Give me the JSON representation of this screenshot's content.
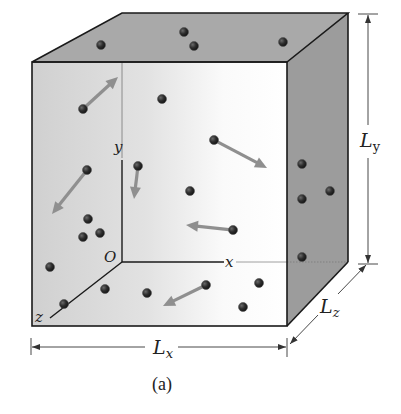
{
  "figure": {
    "caption": "(a)"
  },
  "axes": {
    "origin_label": "O",
    "x_label": "x",
    "y_label": "y",
    "z_label": "z"
  },
  "dimensions": {
    "Lx": {
      "main": "L",
      "sub": "x"
    },
    "Ly": {
      "main": "L",
      "sub": "y"
    },
    "Lz": {
      "main": "L",
      "sub": "z"
    }
  },
  "colors": {
    "top_face": "#a8a8a8",
    "right_face": "#9a9a9a",
    "front_face_left": "#d2d2d2",
    "front_face_right": "#fbfbfb",
    "edge": "#1a1a1a",
    "molecule": "#2a2a2a",
    "arrow": "#8f8f8f",
    "dimension_line": "#444444"
  },
  "molecules": [
    {
      "x": 101,
      "y": 45
    },
    {
      "x": 184,
      "y": 32
    },
    {
      "x": 194,
      "y": 46
    },
    {
      "x": 283,
      "y": 42
    },
    {
      "x": 83,
      "y": 109
    },
    {
      "x": 162,
      "y": 99
    },
    {
      "x": 214,
      "y": 140
    },
    {
      "x": 138,
      "y": 166
    },
    {
      "x": 87,
      "y": 170
    },
    {
      "x": 190,
      "y": 191
    },
    {
      "x": 88,
      "y": 219
    },
    {
      "x": 83,
      "y": 237
    },
    {
      "x": 100,
      "y": 233
    },
    {
      "x": 233,
      "y": 230
    },
    {
      "x": 50,
      "y": 267
    },
    {
      "x": 105,
      "y": 289
    },
    {
      "x": 147,
      "y": 293
    },
    {
      "x": 206,
      "y": 285
    },
    {
      "x": 259,
      "y": 283
    },
    {
      "x": 243,
      "y": 307
    },
    {
      "x": 64,
      "y": 304
    },
    {
      "x": 302,
      "y": 164
    },
    {
      "x": 302,
      "y": 199
    },
    {
      "x": 330,
      "y": 191
    },
    {
      "x": 302,
      "y": 257
    }
  ],
  "velocity_arrows": [
    {
      "x1": 83,
      "y1": 109,
      "x2": 118,
      "y2": 77
    },
    {
      "x1": 214,
      "y1": 140,
      "x2": 267,
      "y2": 168
    },
    {
      "x1": 138,
      "y1": 166,
      "x2": 134,
      "y2": 199
    },
    {
      "x1": 87,
      "y1": 170,
      "x2": 52,
      "y2": 214
    },
    {
      "x1": 233,
      "y1": 230,
      "x2": 186,
      "y2": 225
    },
    {
      "x1": 206,
      "y1": 285,
      "x2": 163,
      "y2": 306
    }
  ]
}
